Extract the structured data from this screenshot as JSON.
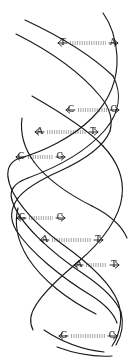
{
  "figure": {
    "width": 134,
    "height": 357,
    "background_color": "#ffffff",
    "stroke_color": "#1a1a1a",
    "text_color": "#111111"
  },
  "legend": {
    "bond_style": "dotted",
    "bond_rows": 2,
    "arrow_direction": "outward-to-backbone"
  },
  "base_pairs": [
    {
      "index": 0,
      "left_base": "T",
      "right_base": "A",
      "y": 43,
      "left_x": 63,
      "right_x": 113,
      "arrow_left": true,
      "arrow_right": true,
      "bond_x1": 70,
      "bond_x2": 106
    },
    {
      "index": 1,
      "left_base": "C",
      "right_base": "G",
      "y": 110,
      "left_x": 71,
      "right_x": 114,
      "arrow_left": true,
      "arrow_right": true,
      "bond_x1": 78,
      "bond_x2": 107
    },
    {
      "index": 2,
      "left_base": "A",
      "right_base": "T",
      "y": 132,
      "left_x": 40,
      "right_x": 93,
      "arrow_left": true,
      "arrow_right": true,
      "bond_x1": 47,
      "bond_x2": 86
    },
    {
      "index": 3,
      "left_base": "C",
      "right_base": "G",
      "y": 157,
      "left_x": 21,
      "right_x": 60,
      "arrow_left": true,
      "arrow_right": true,
      "bond_x1": 28,
      "bond_x2": 53
    },
    {
      "index": 4,
      "left_base": "G",
      "right_base": "C",
      "y": 218,
      "left_x": 22,
      "right_x": 60,
      "arrow_left": true,
      "arrow_right": true,
      "bond_x1": 29,
      "bond_x2": 53
    },
    {
      "index": 5,
      "left_base": "A",
      "right_base": "T",
      "y": 240,
      "left_x": 45,
      "right_x": 98,
      "arrow_left": true,
      "arrow_right": true,
      "bond_x1": 52,
      "bond_x2": 91
    },
    {
      "index": 6,
      "left_base": "A",
      "right_base": "T",
      "y": 265,
      "left_x": 79,
      "right_x": 114,
      "arrow_left": true,
      "arrow_right": true,
      "bond_x1": 86,
      "bond_x2": 107
    },
    {
      "index": 7,
      "left_base": "G",
      "right_base": "C",
      "y": 336,
      "left_x": 64,
      "right_x": 112,
      "arrow_left": true,
      "arrow_right": true,
      "bond_x1": 71,
      "bond_x2": 105
    }
  ],
  "sequence": {
    "left_strand": "T C A C G A A G",
    "right_strand": "A G T G C T T C"
  }
}
